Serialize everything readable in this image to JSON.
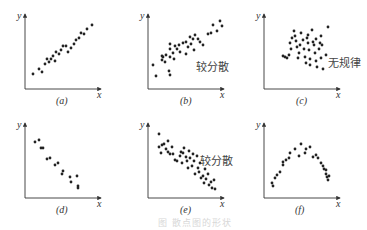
{
  "figure": {
    "caption": "图 散点图的形状",
    "axis_x_label": "x",
    "axis_y_label": "y"
  },
  "chart_data": [
    {
      "type": "scatter",
      "panel": "(a)",
      "title": "",
      "annotation": "",
      "xlabel": "x",
      "ylabel": "y",
      "description": "strong positive linear correlation",
      "origin": [
        25,
        89
      ],
      "points": [
        [
          8,
          15
        ],
        [
          14,
          20
        ],
        [
          17,
          17
        ],
        [
          20,
          25
        ],
        [
          24,
          27
        ],
        [
          22,
          30
        ],
        [
          26,
          30
        ],
        [
          28,
          33
        ],
        [
          30,
          28
        ],
        [
          31,
          37
        ],
        [
          34,
          35
        ],
        [
          36,
          39
        ],
        [
          38,
          43
        ],
        [
          41,
          43
        ],
        [
          43,
          37
        ],
        [
          46,
          41
        ],
        [
          49,
          45
        ],
        [
          51,
          49
        ],
        [
          54,
          51
        ],
        [
          56,
          56
        ],
        [
          59,
          55
        ],
        [
          62,
          60
        ],
        [
          67,
          64
        ]
      ]
    },
    {
      "type": "scatter",
      "panel": "(b)",
      "title": "",
      "annotation": "较分散",
      "xlabel": "x",
      "ylabel": "y",
      "description": "positive correlation, more scattered",
      "origin": [
        148,
        89
      ],
      "points": [
        [
          5,
          24
        ],
        [
          8,
          13
        ],
        [
          14,
          29
        ],
        [
          15,
          32
        ],
        [
          14,
          33
        ],
        [
          17,
          27
        ],
        [
          18,
          34
        ],
        [
          22,
          32
        ],
        [
          22,
          14
        ],
        [
          21,
          18
        ],
        [
          22,
          40
        ],
        [
          22,
          45
        ],
        [
          25,
          36
        ],
        [
          26,
          30
        ],
        [
          27,
          43
        ],
        [
          29,
          40
        ],
        [
          32,
          37
        ],
        [
          31,
          44
        ],
        [
          35,
          46
        ],
        [
          38,
          47
        ],
        [
          38,
          35
        ],
        [
          40,
          42
        ],
        [
          43,
          45
        ],
        [
          42,
          52
        ],
        [
          45,
          50
        ],
        [
          47,
          54
        ],
        [
          46,
          39
        ],
        [
          50,
          50
        ],
        [
          52,
          47
        ],
        [
          55,
          44
        ],
        [
          60,
          55
        ],
        [
          63,
          56
        ],
        [
          65,
          64
        ],
        [
          69,
          58
        ],
        [
          72,
          68
        ],
        [
          74,
          63
        ]
      ]
    },
    {
      "type": "scatter",
      "panel": "(c)",
      "title": "",
      "annotation": "无规律",
      "xlabel": "x",
      "ylabel": "y",
      "description": "no correlation",
      "origin": [
        264,
        89
      ],
      "points": [
        [
          19,
          33
        ],
        [
          21,
          32
        ],
        [
          23,
          31
        ],
        [
          25,
          34
        ],
        [
          27,
          40
        ],
        [
          26,
          46
        ],
        [
          28,
          51
        ],
        [
          30,
          58
        ],
        [
          31,
          53
        ],
        [
          32,
          48
        ],
        [
          33,
          42
        ],
        [
          35,
          36
        ],
        [
          34,
          31
        ],
        [
          36,
          44
        ],
        [
          37,
          56
        ],
        [
          39,
          49
        ],
        [
          40,
          40
        ],
        [
          41,
          32
        ],
        [
          43,
          51
        ],
        [
          44,
          54
        ],
        [
          44,
          46
        ],
        [
          45,
          39
        ],
        [
          46,
          30
        ],
        [
          46,
          24
        ],
        [
          48,
          59
        ],
        [
          49,
          47
        ],
        [
          50,
          44
        ],
        [
          51,
          36
        ],
        [
          52,
          50
        ],
        [
          52,
          28
        ],
        [
          53,
          22
        ],
        [
          55,
          40
        ],
        [
          56,
          46
        ],
        [
          57,
          53
        ],
        [
          57,
          31
        ],
        [
          58,
          44
        ],
        [
          62,
          34
        ],
        [
          64,
          62
        ],
        [
          59,
          20
        ],
        [
          42,
          26
        ]
      ]
    },
    {
      "type": "scatter",
      "panel": "(d)",
      "title": "",
      "annotation": "",
      "xlabel": "x",
      "ylabel": "y",
      "description": "strong negative linear correlation",
      "origin": [
        25,
        198
      ],
      "points": [
        [
          10,
          56
        ],
        [
          14,
          58
        ],
        [
          16,
          50
        ],
        [
          18,
          50
        ],
        [
          22,
          39
        ],
        [
          25,
          40
        ],
        [
          30,
          33
        ],
        [
          33,
          35
        ],
        [
          38,
          27
        ],
        [
          37,
          24
        ],
        [
          45,
          21
        ],
        [
          46,
          16
        ],
        [
          52,
          22
        ],
        [
          53,
          12
        ],
        [
          53,
          10
        ]
      ]
    },
    {
      "type": "scatter",
      "panel": "(e)",
      "title": "",
      "annotation": "较分散",
      "xlabel": "x",
      "ylabel": "y",
      "description": "negative correlation, more scattered",
      "origin": [
        148,
        198
      ],
      "points": [
        [
          11,
          64
        ],
        [
          14,
          53
        ],
        [
          11,
          51
        ],
        [
          13,
          45
        ],
        [
          16,
          54
        ],
        [
          18,
          49
        ],
        [
          20,
          57
        ],
        [
          20,
          46
        ],
        [
          22,
          44
        ],
        [
          24,
          51
        ],
        [
          25,
          44
        ],
        [
          27,
          38
        ],
        [
          29,
          37
        ],
        [
          32,
          42
        ],
        [
          33,
          46
        ],
        [
          34,
          35
        ],
        [
          36,
          50
        ],
        [
          35,
          45
        ],
        [
          38,
          41
        ],
        [
          39,
          37
        ],
        [
          40,
          30
        ],
        [
          41,
          47
        ],
        [
          42,
          40
        ],
        [
          44,
          32
        ],
        [
          45,
          44
        ],
        [
          46,
          37
        ],
        [
          47,
          24
        ],
        [
          49,
          42
        ],
        [
          50,
          30
        ],
        [
          51,
          26
        ],
        [
          52,
          35
        ],
        [
          53,
          20
        ],
        [
          55,
          22
        ],
        [
          56,
          15
        ],
        [
          57,
          29
        ],
        [
          58,
          19
        ],
        [
          60,
          24
        ],
        [
          61,
          13
        ],
        [
          63,
          16
        ],
        [
          64,
          10
        ],
        [
          66,
          18
        ],
        [
          67,
          9
        ]
      ]
    },
    {
      "type": "scatter",
      "panel": "(f)",
      "title": "",
      "annotation": "",
      "xlabel": "x",
      "ylabel": "y",
      "description": "curvilinear (inverted U) relationship",
      "origin": [
        264,
        198
      ],
      "points": [
        [
          8,
          15
        ],
        [
          9,
          12
        ],
        [
          11,
          20
        ],
        [
          13,
          23
        ],
        [
          16,
          26
        ],
        [
          19,
          33
        ],
        [
          19,
          36
        ],
        [
          22,
          38
        ],
        [
          25,
          40
        ],
        [
          26,
          45
        ],
        [
          31,
          49
        ],
        [
          35,
          42
        ],
        [
          37,
          54
        ],
        [
          41,
          45
        ],
        [
          42,
          49
        ],
        [
          46,
          51
        ],
        [
          49,
          41
        ],
        [
          52,
          43
        ],
        [
          54,
          40
        ],
        [
          57,
          35
        ],
        [
          59,
          32
        ],
        [
          60,
          29
        ],
        [
          62,
          28
        ],
        [
          62,
          24
        ],
        [
          63,
          21
        ],
        [
          64,
          18
        ],
        [
          65,
          22
        ]
      ]
    }
  ],
  "panels": [
    {
      "label": "(a)",
      "annotation": ""
    },
    {
      "label": "(b)",
      "annotation": "较分散"
    },
    {
      "label": "(c)",
      "annotation": "无规律"
    },
    {
      "label": "(d)",
      "annotation": ""
    },
    {
      "label": "(e)",
      "annotation": "较分散"
    },
    {
      "label": "(f)",
      "annotation": ""
    }
  ]
}
